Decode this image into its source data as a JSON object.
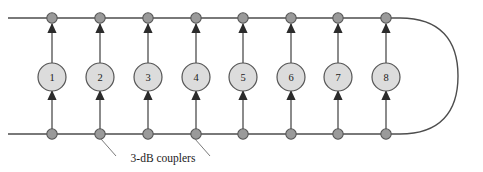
{
  "figure": {
    "name": "fiber-loop-amplifier-chain-diagram",
    "width": 483,
    "height": 172,
    "background_color": "#ffffff"
  },
  "style": {
    "line_color": "#4d4d4d",
    "branch_color": "#4d4d4d",
    "arrow_color": "#2b2b2b",
    "coupler_fill": "#9a9a9a",
    "coupler_stroke": "#555555",
    "amplifier_fill": "#dcdcdc",
    "amplifier_stroke": "#555555",
    "text_color": "#1a1a1a",
    "leader_color": "#6b6b6b"
  },
  "geometry": {
    "top_rail_y": 18,
    "bottom_rail_y": 134,
    "rail_left_x": 8,
    "rail_right_x": 400,
    "loop_right_x": 458,
    "coupler_radius": 5.2,
    "amplifier_radius": 14,
    "amplifier_center_y": 77
  },
  "top_rail": {
    "label": "top-waveguide-rail",
    "y": 18,
    "x_start": 8,
    "x_end": 400
  },
  "bottom_rail": {
    "label": "bottom-waveguide-rail",
    "y": 134,
    "x_start": 8,
    "x_end": 400
  },
  "loop": {
    "label": "right-loopback-curve",
    "description": "rounded u-turn joining top and bottom rails on the right",
    "x_extent": 458
  },
  "amplifiers": [
    {
      "id": 1,
      "label": "1",
      "x": 52
    },
    {
      "id": 2,
      "label": "2",
      "x": 100
    },
    {
      "id": 3,
      "label": "3",
      "x": 148
    },
    {
      "id": 4,
      "label": "4",
      "x": 196
    },
    {
      "id": 5,
      "label": "5",
      "x": 243
    },
    {
      "id": 6,
      "label": "6",
      "x": 291
    },
    {
      "id": 7,
      "label": "7",
      "x": 338
    },
    {
      "id": 8,
      "label": "8",
      "x": 386
    }
  ],
  "couplers": {
    "name": "3-dB couplers",
    "top_x": [
      52,
      100,
      148,
      196,
      243,
      291,
      338,
      386
    ],
    "bottom_x": [
      52,
      100,
      148,
      196,
      243,
      291,
      338,
      386
    ],
    "count": 16
  },
  "caption": {
    "text": "3-dB couplers",
    "x": 162,
    "y": 158,
    "leaders": [
      {
        "from_x": 100,
        "from_y": 140,
        "to_x": 114,
        "to_y": 155,
        "target": "coupler-bottom-2"
      },
      {
        "from_x": 196,
        "from_y": 140,
        "to_x": 210,
        "to_y": 155,
        "target": "coupler-bottom-4"
      }
    ]
  }
}
